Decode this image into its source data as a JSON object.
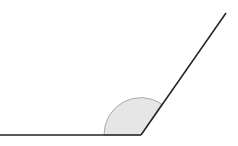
{
  "diagram": {
    "type": "angle",
    "vertex": [
      141,
      135
    ],
    "left_ray_end": [
      0,
      135
    ],
    "right_ray_end": [
      226,
      13
    ],
    "arc_radius": 37,
    "colors": {
      "line": "#222222",
      "arc_fill": "#e6e6e6",
      "arc_stroke": "#aaaaaa",
      "background": "#ffffff"
    }
  }
}
